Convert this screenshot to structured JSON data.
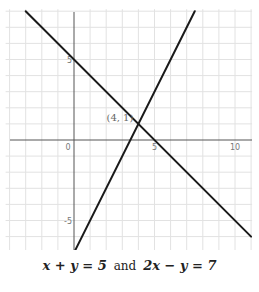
{
  "chart_data": {
    "type": "line",
    "title": "",
    "xlabel": "",
    "ylabel": "",
    "xlim": [
      -4,
      11
    ],
    "ylim": [
      -7,
      8
    ],
    "grid": true,
    "x_ticks": [
      {
        "value": 0,
        "label": "0"
      },
      {
        "value": 5,
        "label": "5"
      },
      {
        "value": 10,
        "label": "10"
      }
    ],
    "y_ticks": [
      {
        "value": 5,
        "label": "5"
      },
      {
        "value": -5,
        "label": "-5"
      }
    ],
    "series": [
      {
        "name": "x + y = 5",
        "points": [
          [
            -3.0,
            8.0
          ],
          [
            11.0,
            -6.0
          ]
        ],
        "color": "#1a1a1a"
      },
      {
        "name": "2x − y = 7",
        "points": [
          [
            0.0,
            -7.0
          ],
          [
            7.5,
            8.0
          ]
        ],
        "color": "#1a1a1a"
      }
    ],
    "annotations": [
      {
        "text": "(4, 1)",
        "x": 4,
        "y": 1
      }
    ],
    "caption": {
      "eq1": "x + y = 5",
      "joiner": "and",
      "eq2": "2x − y = 7"
    }
  },
  "colors": {
    "grid": "#e2e2e2",
    "axis": "#555555",
    "line": "#1a1a1a",
    "label": "#777777"
  }
}
